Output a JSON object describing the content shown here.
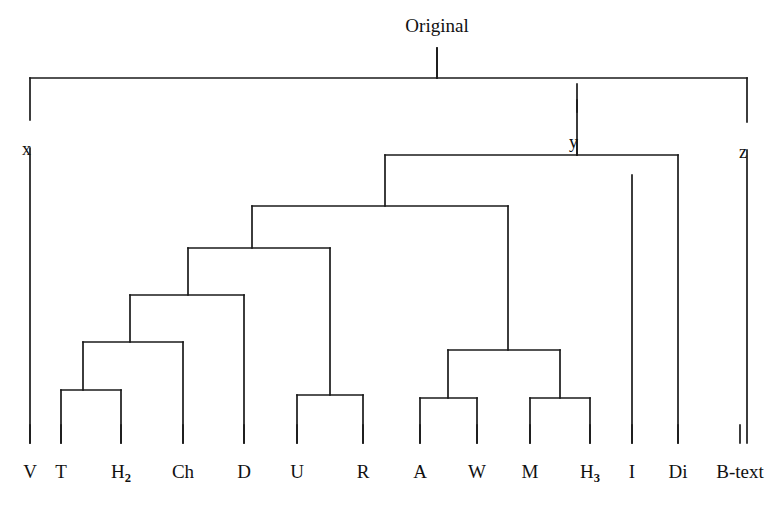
{
  "figure": {
    "type": "dendrogram",
    "title": "Original",
    "orientation": "top-down",
    "stroke_color": "#1a1a1a",
    "background_color": "#ffffff"
  },
  "root": {
    "label": "Original",
    "x": 437,
    "stem_top_y": 36,
    "bar_y": 78
  },
  "internal_nodes": [
    {
      "id": "x",
      "label": "x",
      "x": 30,
      "label_x": 22,
      "label_y": 140
    },
    {
      "id": "y",
      "label": "y",
      "x": 577,
      "label_x": 569,
      "label_y": 133
    },
    {
      "id": "z",
      "label": "z",
      "x": 747,
      "label_x": 739,
      "label_y": 143
    }
  ],
  "leaves": [
    {
      "label": "V",
      "sub": "",
      "x": 30,
      "top_y": 78
    },
    {
      "label": "T",
      "sub": "",
      "x": 61,
      "top_y": 390
    },
    {
      "label": "H",
      "sub": "2",
      "x": 121,
      "top_y": 390
    },
    {
      "label": "Ch",
      "sub": "",
      "x": 183,
      "top_y": 342
    },
    {
      "label": "D",
      "sub": "",
      "x": 244,
      "top_y": 295
    },
    {
      "label": "U",
      "sub": "",
      "x": 297,
      "top_y": 395
    },
    {
      "label": "R",
      "sub": "",
      "x": 363,
      "top_y": 395
    },
    {
      "label": "A",
      "sub": "",
      "x": 420,
      "top_y": 398
    },
    {
      "label": "W",
      "sub": "",
      "x": 477,
      "top_y": 398
    },
    {
      "label": "M",
      "sub": "",
      "x": 530,
      "top_y": 398
    },
    {
      "label": "H",
      "sub": "3",
      "x": 590,
      "top_y": 398
    },
    {
      "label": "I",
      "sub": "",
      "x": 632,
      "top_y": 175
    },
    {
      "label": "Di",
      "sub": "",
      "x": 678,
      "top_y": 155
    },
    {
      "label": "B-text",
      "sub": "",
      "x": 740,
      "top_y": 78
    }
  ],
  "leaf_label_y": 462,
  "leaf_tick_top": 425,
  "leaf_tick_bottom": 443,
  "clade_bars": [
    {
      "name": "root-bar",
      "y": 78,
      "x1": 30,
      "x2": 747,
      "stem_x": 437,
      "stem_from_y": 48
    },
    {
      "name": "y-bar",
      "y": 155,
      "x1": 385,
      "x2": 678,
      "stem_x": 577,
      "stem_from_y": 100
    },
    {
      "name": "level2-bar",
      "y": 206,
      "x1": 252,
      "x2": 508,
      "stem_x": 385,
      "stem_from_y": 155
    },
    {
      "name": "level3-bar",
      "y": 248,
      "x1": 188,
      "x2": 330,
      "stem_x": 252,
      "stem_from_y": 206
    },
    {
      "name": "level4-bar",
      "y": 295,
      "x1": 130,
      "x2": 244,
      "stem_x": 188,
      "stem_from_y": 248
    },
    {
      "name": "level5-bar",
      "y": 342,
      "x1": 83,
      "x2": 183,
      "stem_x": 130,
      "stem_from_y": 295
    },
    {
      "name": "v-t-bar",
      "y": 390,
      "x1": 61,
      "x2": 121,
      "stem_x": 83,
      "stem_from_y": 342
    },
    {
      "name": "u-r-bar",
      "y": 395,
      "x1": 297,
      "x2": 363,
      "stem_x": 330,
      "stem_from_y": 248
    },
    {
      "name": "aw-mh3-bar",
      "y": 350,
      "x1": 448,
      "x2": 560,
      "stem_x": 508,
      "stem_from_y": 206
    },
    {
      "name": "a-w-bar",
      "y": 398,
      "x1": 420,
      "x2": 477,
      "stem_x": 448,
      "stem_from_y": 350
    },
    {
      "name": "m-h3-bar",
      "y": 398,
      "x1": 530,
      "x2": 590,
      "stem_x": 560,
      "stem_from_y": 350
    }
  ],
  "drop_lines": [
    {
      "name": "x-drop-upper",
      "x": 30,
      "y1": 78,
      "y2": 120
    },
    {
      "name": "x-drop-lower",
      "x": 30,
      "y1": 148,
      "y2": 443
    },
    {
      "name": "y-drop-upper",
      "x": 577,
      "y1": 84,
      "y2": 112
    },
    {
      "name": "y-drop-lower",
      "x": 577,
      "y1": 140,
      "y2": 155
    },
    {
      "name": "z-drop-upper",
      "x": 747,
      "y1": 78,
      "y2": 122
    },
    {
      "name": "z-drop-lower",
      "x": 747,
      "y1": 150,
      "y2": 443
    },
    {
      "name": "I-leaf-line",
      "x": 632,
      "y1": 175,
      "y2": 443
    },
    {
      "name": "Di-leaf-line",
      "x": 678,
      "y1": 155,
      "y2": 443
    },
    {
      "name": "Ch-leaf-line",
      "x": 183,
      "y1": 342,
      "y2": 443
    },
    {
      "name": "D-leaf-line",
      "x": 244,
      "y1": 295,
      "y2": 443
    },
    {
      "name": "V-leaf-line",
      "x": 61,
      "y1": 390,
      "y2": 443
    },
    {
      "name": "T-leaf-line",
      "x": 121,
      "y1": 390,
      "y2": 443
    },
    {
      "name": "U-leaf-line",
      "x": 297,
      "y1": 395,
      "y2": 443
    },
    {
      "name": "R-leaf-line",
      "x": 363,
      "y1": 395,
      "y2": 443
    },
    {
      "name": "A-leaf-line",
      "x": 420,
      "y1": 398,
      "y2": 443
    },
    {
      "name": "W-leaf-line",
      "x": 477,
      "y1": 398,
      "y2": 443
    },
    {
      "name": "M-leaf-line",
      "x": 530,
      "y1": 398,
      "y2": 443
    },
    {
      "name": "H3-leaf-line",
      "x": 590,
      "y1": 398,
      "y2": 443
    }
  ]
}
